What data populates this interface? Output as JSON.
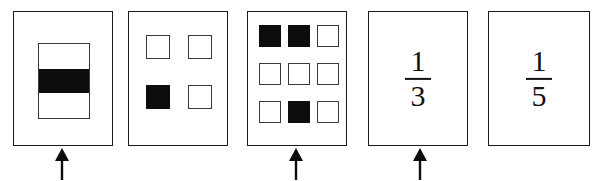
{
  "figure": {
    "ink_color": "#0d0d0d",
    "line_color": "#3a3a3a",
    "background": "#ffffff"
  },
  "panels": [
    {
      "id": "panel-1",
      "kind": "bar-model",
      "label": "rectangle divided into 3 horizontal bands",
      "total_parts": 3,
      "shaded_parts": 1,
      "shaded_indexes": [
        1
      ],
      "fraction_value": "1/3",
      "has_arrow": true
    },
    {
      "id": "panel-2",
      "kind": "square-grid",
      "label": "2 by 2 grid of squares",
      "rows": 2,
      "cols": 2,
      "total_parts": 4,
      "shaded_parts": 1,
      "shaded_indexes": [
        2
      ],
      "fraction_value": "1/4",
      "has_arrow": false
    },
    {
      "id": "panel-3",
      "kind": "square-grid",
      "label": "3 by 3 grid of squares",
      "rows": 3,
      "cols": 3,
      "total_parts": 9,
      "shaded_parts": 3,
      "shaded_indexes": [
        0,
        1,
        7
      ],
      "fraction_value": "3/9",
      "has_arrow": true
    },
    {
      "id": "panel-4",
      "kind": "fraction",
      "numerator": "1",
      "denominator": "3",
      "fraction_value": "1/3",
      "has_arrow": true
    },
    {
      "id": "panel-5",
      "kind": "fraction",
      "numerator": "1",
      "denominator": "5",
      "fraction_value": "1/5",
      "has_arrow": false
    }
  ],
  "arrows": [
    {
      "id": "arrow-panel-1",
      "points_to": "panel-1",
      "direction": "up"
    },
    {
      "id": "arrow-panel-3",
      "points_to": "panel-3",
      "direction": "up"
    },
    {
      "id": "arrow-panel-4",
      "points_to": "panel-4",
      "direction": "up"
    }
  ]
}
